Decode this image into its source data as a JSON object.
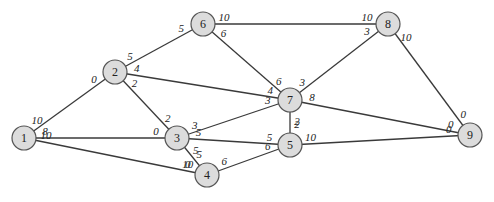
{
  "graph": {
    "title": "",
    "nodes": [
      {
        "id": "1",
        "label": "1",
        "x": 24,
        "y": 138
      },
      {
        "id": "2",
        "label": "2",
        "x": 115,
        "y": 72
      },
      {
        "id": "3",
        "label": "3",
        "x": 177,
        "y": 138
      },
      {
        "id": "4",
        "label": "4",
        "x": 207,
        "y": 175
      },
      {
        "id": "5",
        "label": "5",
        "x": 290,
        "y": 145
      },
      {
        "id": "6",
        "label": "6",
        "x": 203,
        "y": 24
      },
      {
        "id": "7",
        "label": "7",
        "x": 290,
        "y": 100
      },
      {
        "id": "8",
        "label": "8",
        "x": 388,
        "y": 24
      },
      {
        "id": "9",
        "label": "9",
        "x": 470,
        "y": 135
      }
    ],
    "edges": [
      {
        "from": "1",
        "to": "2",
        "label_from": "10",
        "label_to": "0"
      },
      {
        "from": "1",
        "to": "3",
        "label_from": "8",
        "label_to": "0"
      },
      {
        "from": "1",
        "to": "4",
        "label_from": "10",
        "label_to": "10"
      },
      {
        "from": "2",
        "to": "6",
        "label_from": "5",
        "label_to": "5"
      },
      {
        "from": "2",
        "to": "7",
        "label_from": "4",
        "label_to": "4"
      },
      {
        "from": "2",
        "to": "3",
        "label_from": "2",
        "label_to": "2"
      },
      {
        "from": "3",
        "to": "7",
        "label_from": "3",
        "label_to": "3"
      },
      {
        "from": "3",
        "to": "5",
        "label_from": "5",
        "label_to": "5"
      },
      {
        "from": "3",
        "to": "4",
        "label_from": "5",
        "label_to": "5"
      },
      {
        "from": "4",
        "to": "5",
        "label_from": "6",
        "label_to": "6"
      },
      {
        "from": "4",
        "to": "1",
        "label_from": "0",
        "label_to": ""
      },
      {
        "from": "6",
        "to": "8",
        "label_from": "10",
        "label_to": "10"
      },
      {
        "from": "6",
        "to": "7",
        "label_from": "6",
        "label_to": "6"
      },
      {
        "from": "7",
        "to": "8",
        "label_from": "3",
        "label_to": "3"
      },
      {
        "from": "7",
        "to": "9",
        "label_from": "8",
        "label_to": "0"
      },
      {
        "from": "7",
        "to": "5",
        "label_from": "2",
        "label_to": "2"
      },
      {
        "from": "8",
        "to": "9",
        "label_from": "10",
        "label_to": "0"
      },
      {
        "from": "5",
        "to": "9",
        "label_from": "10",
        "label_to": "0"
      }
    ]
  }
}
